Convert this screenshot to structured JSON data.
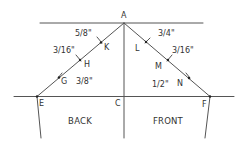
{
  "diagram": {
    "colors": {
      "line": "#555555",
      "text": "#333333",
      "background": "#ffffff"
    },
    "points": {
      "A": {
        "label": "A",
        "x": 124,
        "y": 23
      },
      "C": {
        "label": "C",
        "x": 124,
        "y": 96
      },
      "E": {
        "label": "E",
        "x": 37,
        "y": 96
      },
      "F": {
        "label": "F",
        "x": 210,
        "y": 97
      },
      "K": {
        "label": "K",
        "x": 101,
        "y": 42
      },
      "H": {
        "label": "H",
        "x": 80,
        "y": 59
      },
      "G": {
        "label": "G",
        "x": 59,
        "y": 77
      },
      "L": {
        "label": "L",
        "x": 146,
        "y": 42
      },
      "M": {
        "label": "M",
        "x": 168,
        "y": 59
      },
      "N": {
        "label": "N",
        "x": 189,
        "y": 77
      }
    },
    "measurements": {
      "AK": "5/8\"",
      "KH": "3/16\"",
      "HG": "3/8\"",
      "AL": "3/4\"",
      "LM": "3/16\"",
      "MN": "1/2\""
    },
    "regions": {
      "back": "BACK",
      "front": "FRONT"
    }
  }
}
